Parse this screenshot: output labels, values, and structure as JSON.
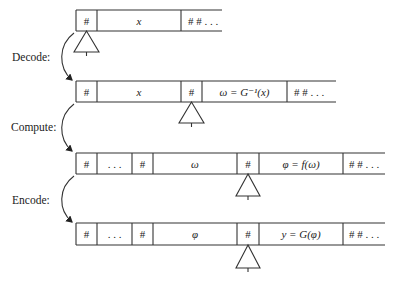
{
  "diagram": {
    "type": "turing-machine-tape-transformation",
    "steps": [
      {
        "label": "Decode:"
      },
      {
        "label": "Compute:"
      },
      {
        "label": "Encode:"
      }
    ],
    "tapes": [
      {
        "name": "tape-input",
        "cells": [
          {
            "text": "#",
            "italic": false
          },
          {
            "text": "x",
            "italic": true
          },
          {
            "text": "# # . . .",
            "italic": false,
            "open": true
          }
        ],
        "head_cell": 0
      },
      {
        "name": "tape-decoded",
        "cells": [
          {
            "text": "#",
            "italic": false
          },
          {
            "text": "x",
            "italic": true
          },
          {
            "text": "#",
            "italic": false
          },
          {
            "text": "ω = G⁻¹(x)",
            "italic": true
          },
          {
            "text": "# # . . .",
            "italic": false,
            "open": true
          }
        ],
        "head_cell": 2
      },
      {
        "name": "tape-computed",
        "cells": [
          {
            "text": "#",
            "italic": false
          },
          {
            "text": ". . .",
            "italic": false
          },
          {
            "text": "#",
            "italic": false
          },
          {
            "text": "ω",
            "italic": true
          },
          {
            "text": "#",
            "italic": false
          },
          {
            "text": "φ = f(ω)",
            "italic": true
          },
          {
            "text": "# # . . .",
            "italic": false,
            "open": true
          }
        ],
        "head_cell": 4
      },
      {
        "name": "tape-encoded",
        "cells": [
          {
            "text": "#",
            "italic": false
          },
          {
            "text": ". . .",
            "italic": false
          },
          {
            "text": "#",
            "italic": false
          },
          {
            "text": "φ",
            "italic": true
          },
          {
            "text": "#",
            "italic": false
          },
          {
            "text": "y = G(φ)",
            "italic": true
          },
          {
            "text": "# # . . .",
            "italic": false,
            "open": true
          }
        ],
        "head_cell": 4
      }
    ],
    "colors": {
      "ink": "#333333",
      "background": "#ffffff"
    }
  }
}
